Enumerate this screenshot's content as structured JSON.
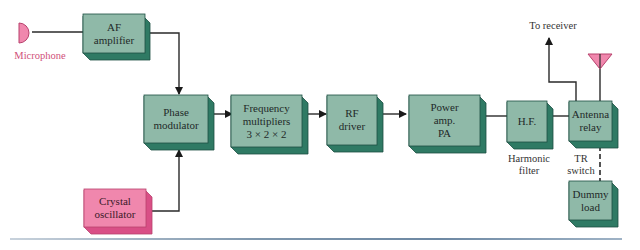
{
  "diagram": {
    "type": "block-diagram",
    "colors": {
      "block_face": "#8fb9a8",
      "block_side": "#2f7a64",
      "block_edge": "#1d4f42",
      "pink_face": "#f087ad",
      "pink_side": "#d94f86",
      "wire": "#2a2a2a"
    },
    "blocks": {
      "af_amplifier": {
        "label_1": "AF",
        "label_2": "amplifier"
      },
      "phase_modulator": {
        "label_1": "Phase",
        "label_2": "modulator"
      },
      "freq_multipliers": {
        "label_1": "Frequency",
        "label_2": "multipliers",
        "label_3": "3 × 2 × 2"
      },
      "rf_driver": {
        "label_1": "RF",
        "label_2": "driver"
      },
      "power_amp": {
        "label_1": "Power",
        "label_2": "amp.",
        "label_3": "PA"
      },
      "hf_filter": {
        "label_1": "H.F."
      },
      "antenna_relay": {
        "label_1": "Antenna",
        "label_2": "relay"
      },
      "dummy_load": {
        "label_1": "Dummy",
        "label_2": "load"
      },
      "crystal_oscillator": {
        "label_1": "Crystal",
        "label_2": "oscillator"
      }
    },
    "labels": {
      "microphone": "Microphone",
      "to_receiver": "To receiver",
      "harmonic_1": "Harmonic",
      "harmonic_2": "filter",
      "tr_1": "TR",
      "tr_2": "switch"
    },
    "connections": [
      [
        "Microphone",
        "AF amplifier"
      ],
      [
        "AF amplifier",
        "Phase modulator"
      ],
      [
        "Crystal oscillator",
        "Phase modulator"
      ],
      [
        "Phase modulator",
        "Frequency multipliers"
      ],
      [
        "Frequency multipliers",
        "RF driver"
      ],
      [
        "RF driver",
        "Power amp. PA"
      ],
      [
        "Power amp. PA",
        "H.F."
      ],
      [
        "H.F.",
        "Antenna relay"
      ],
      [
        "Antenna relay",
        "To receiver"
      ],
      [
        "Antenna relay",
        "Antenna"
      ],
      [
        "Antenna relay",
        "Dummy load (dashed)"
      ]
    ]
  }
}
